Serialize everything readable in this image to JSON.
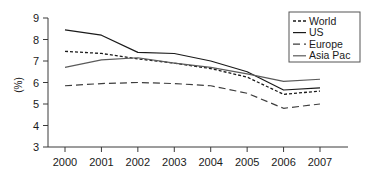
{
  "chart_data": {
    "type": "line",
    "title": "",
    "xlabel": "",
    "ylabel": "(%)",
    "categories": [
      "2000",
      "2001",
      "2002",
      "2003",
      "2004",
      "2005",
      "2006",
      "2007"
    ],
    "x": [
      2000,
      2001,
      2002,
      2003,
      2004,
      2005,
      2006,
      2007
    ],
    "ylim": [
      3,
      9
    ],
    "yticks": [
      3,
      4,
      5,
      6,
      7,
      8,
      9
    ],
    "ytick_labels": [
      "3",
      "4",
      "5",
      "6",
      "7",
      "8",
      "9"
    ],
    "grid": false,
    "legend_position": "top-right",
    "series": [
      {
        "name": "World",
        "style": "dotted",
        "color": "#1a1a1a",
        "values": [
          7.45,
          7.35,
          7.1,
          6.9,
          6.65,
          6.25,
          5.45,
          5.6
        ]
      },
      {
        "name": "US",
        "style": "solid",
        "color": "#1a1a1a",
        "values": [
          8.45,
          8.2,
          7.4,
          7.35,
          7.0,
          6.5,
          5.65,
          5.75
        ]
      },
      {
        "name": "Europe",
        "style": "dashed",
        "color": "#3d3d3d",
        "values": [
          5.85,
          5.95,
          6.0,
          5.95,
          5.85,
          5.5,
          4.8,
          5.0
        ]
      },
      {
        "name": "Asia Pac",
        "style": "solid",
        "color": "#5a5a5a",
        "values": [
          6.7,
          7.05,
          7.15,
          6.9,
          6.7,
          6.4,
          6.05,
          6.15
        ]
      }
    ]
  },
  "axis": {
    "y_title": "(%)",
    "y_ticks": [
      "9",
      "8",
      "7",
      "6",
      "5",
      "4",
      "3"
    ],
    "x_ticks": [
      "2000",
      "2001",
      "2002",
      "2003",
      "2004",
      "2005",
      "2006",
      "2007"
    ]
  },
  "legend": {
    "entries": [
      {
        "label": "World"
      },
      {
        "label": "US"
      },
      {
        "label": "Europe"
      },
      {
        "label": "Asia Pac"
      }
    ]
  }
}
